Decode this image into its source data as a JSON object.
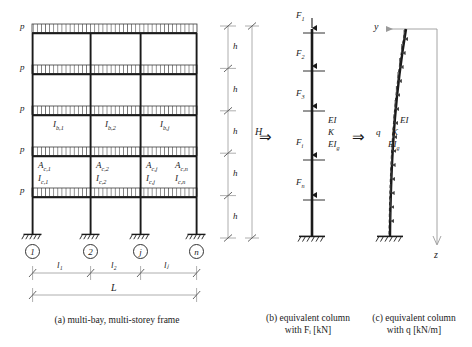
{
  "figure": {
    "panels": [
      {
        "id": "a",
        "caption_line1": "(a) multi-bay, multi-storey frame",
        "caption_line2": ""
      },
      {
        "id": "b",
        "caption_line1": "(b) equivalent column",
        "caption_line2": "with Fᵢ [kN]"
      },
      {
        "id": "c",
        "caption_line1": "(c) equivalent column",
        "caption_line2": "with q [kN/m]"
      }
    ],
    "transform_arrow": "⇒"
  },
  "frame": {
    "storey_load_label": "p",
    "storey_load_count": 5,
    "storey_height_label": "h",
    "storey_count": 5,
    "total_height_label": "H",
    "total_span_label": "L",
    "bay_labels": [
      "l₁",
      "l₂",
      "lⱼ"
    ],
    "beam_inertia_labels": [
      "I",
      "I",
      "I"
    ],
    "beam_inertia_subs": [
      "b,1",
      "b,2",
      "b,j"
    ],
    "column_area_labels": [
      "A",
      "A",
      "A",
      "A"
    ],
    "column_area_subs": [
      "c,1",
      "c,2",
      "c,j",
      "c,n"
    ],
    "column_inertia_labels": [
      "I",
      "I",
      "I",
      "I"
    ],
    "column_inertia_subs": [
      "c,1",
      "c,2",
      "c,j",
      "c,n"
    ],
    "node_numbers": [
      "1",
      "2",
      "j",
      "n"
    ],
    "support_type": "fixed"
  },
  "equivalent_column_b": {
    "force_labels": [
      "F",
      "F",
      "F",
      "F",
      "F"
    ],
    "force_subs": [
      "1",
      "2",
      "3",
      "i",
      "n"
    ],
    "property_labels": [
      "EI",
      "K",
      "EI"
    ],
    "property_subs": [
      "",
      "",
      "g"
    ],
    "support_type": "fixed"
  },
  "equivalent_column_c": {
    "axis_y_label": "y",
    "axis_z_label": "z",
    "distributed_load_label": "q",
    "property_labels": [
      "EI",
      "K",
      "EI"
    ],
    "property_subs": [
      "",
      "",
      "g"
    ],
    "support_type": "fixed"
  },
  "colors": {
    "line": "#1a1a1a",
    "thin_line": "#8a8a8a",
    "background": "#ffffff",
    "hatch": "#555555"
  }
}
